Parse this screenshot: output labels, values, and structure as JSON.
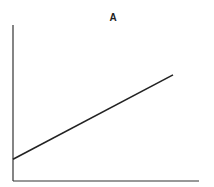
{
  "chart_data": {
    "type": "line",
    "title": "A",
    "xlabel": "",
    "ylabel": "",
    "grid": false,
    "legend": null,
    "x_ticks": [],
    "y_ticks": [],
    "xlim": [
      0,
      1
    ],
    "ylim": [
      0,
      1
    ],
    "series": [
      {
        "name": "A",
        "x": [
          0,
          0.86
        ],
        "y": [
          0.14,
          0.68
        ]
      }
    ],
    "colors": {
      "line": "#222222",
      "axes": "#333333",
      "background": "#ffffff"
    }
  }
}
